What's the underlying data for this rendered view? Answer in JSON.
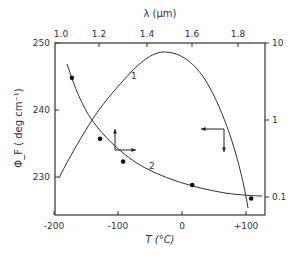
{
  "chart_data": {
    "type": "line",
    "title": "",
    "xlabel": "T (°C)",
    "ylabel": "Φ_F (deg cm⁻¹)",
    "x2label": "λ (µm)",
    "y2label": "",
    "xlim": [
      -200,
      125
    ],
    "ylim": [
      225,
      250
    ],
    "y2lim_log": [
      0.03,
      10
    ],
    "xticks": [
      "-200",
      "-100",
      "0",
      "+100"
    ],
    "yticks": [
      "230",
      "240",
      "250"
    ],
    "x2ticks": [
      "1.0",
      "1.2",
      "1.4",
      "1.6",
      "1.8"
    ],
    "y2ticks": [
      "0.1",
      "1",
      "10"
    ],
    "grid": false,
    "series": [
      {
        "name": "1",
        "axes": "top-right (λ vs log scale)",
        "x_lambda_um": [
          1.0,
          1.1,
          1.2,
          1.3,
          1.4,
          1.48,
          1.55,
          1.6,
          1.7,
          1.8,
          1.84
        ],
        "y_right": [
          0.04,
          0.12,
          0.4,
          1.5,
          5.5,
          8.0,
          6.0,
          3.5,
          1.0,
          0.15,
          0.07
        ]
      },
      {
        "name": "2",
        "axes": "bottom-left (T vs Φ_F)",
        "x": [
          -180,
          -150,
          -120,
          -100,
          -80,
          -50,
          0,
          50,
          100,
          115
        ],
        "y": [
          246,
          240,
          236.5,
          234.5,
          233,
          231,
          229,
          227.8,
          227,
          226.8
        ]
      },
      {
        "name": "measured points",
        "axes": "bottom-left (T vs Φ_F)",
        "x": [
          -172,
          -128,
          -92,
          16,
          108
        ],
        "y": [
          244.8,
          235.7,
          232.3,
          228.8,
          226.8
        ]
      }
    ],
    "annotations": [
      {
        "text": "1",
        "near": "curve 1 rising branch"
      },
      {
        "text": "2",
        "near": "curve 2 lower right"
      },
      {
        "text": "↑→",
        "meaning": "curve 2 uses bottom and left axes"
      },
      {
        "text": "←↓",
        "meaning": "curve 1 uses top and right axes"
      }
    ]
  },
  "labels": {
    "top_axis": "λ (µm)",
    "bottom_axis": "T (°C)",
    "left_axis": "Φ_F  ( deg  cm⁻¹)",
    "curve1": "1",
    "curve2": "2"
  }
}
